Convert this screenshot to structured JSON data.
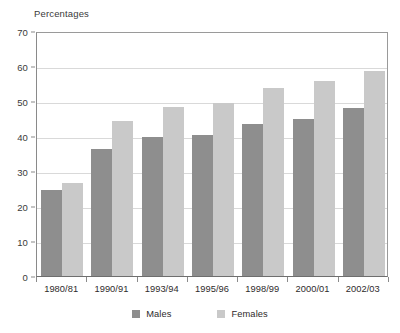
{
  "chart_data": {
    "type": "bar",
    "title": "",
    "ylabel": "Percentages",
    "xlabel": "",
    "categories": [
      "1980/81",
      "1990/91",
      "1993/94",
      "1995/96",
      "1998/99",
      "2000/01",
      "2002/03"
    ],
    "series": [
      {
        "name": "Males",
        "color": "#8e8e8e",
        "values": [
          24.5,
          36.3,
          39.6,
          40.2,
          43.3,
          45.0,
          48.0
        ]
      },
      {
        "name": "Females",
        "color": "#c9c9c9",
        "values": [
          26.7,
          44.2,
          48.2,
          49.5,
          53.6,
          55.6,
          58.5
        ]
      }
    ],
    "ylim": [
      0,
      70
    ],
    "yticks": [
      0,
      10,
      20,
      30,
      40,
      50,
      60,
      70
    ],
    "ytick_labels": [
      "0",
      "10",
      "20",
      "30",
      "40",
      "50",
      "60",
      "70"
    ],
    "grid": true,
    "legend_position": "bottom",
    "legend_entries": [
      "Males",
      "Females"
    ]
  },
  "legend": {
    "males": "Males",
    "females": "Females"
  }
}
